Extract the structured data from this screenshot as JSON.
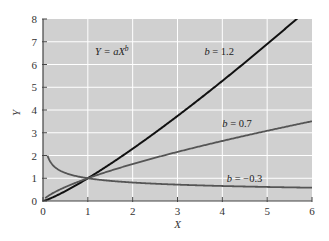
{
  "chart_data": {
    "type": "line",
    "title": "",
    "xlabel": "X",
    "ylabel": "Y",
    "xlim": [
      0,
      6
    ],
    "ylim": [
      0,
      8
    ],
    "xticks": [
      0,
      1,
      2,
      3,
      4,
      5,
      6
    ],
    "yticks": [
      0,
      1,
      2,
      3,
      4,
      5,
      6,
      7,
      8
    ],
    "grid": true,
    "equation_annotation": {
      "lhs": "Y = aX",
      "exponent": "b"
    },
    "series": [
      {
        "name": "b = 1.2",
        "a": 1,
        "b": 1.2,
        "x_start": 0,
        "color": "#111111",
        "label_var": "b",
        "label_rest": " = 1.2",
        "label_at": [
          3.6,
          6.4
        ]
      },
      {
        "name": "b = 0.7",
        "a": 1,
        "b": 0.7,
        "x_start": 0.05,
        "color": "#555555",
        "label_var": "b",
        "label_rest": " = 0.7",
        "label_at": [
          4.0,
          3.25
        ]
      },
      {
        "name": "b = -0.3",
        "a": 1,
        "b": -0.3,
        "x_start": 0.1,
        "color": "#555555",
        "label_var": "b",
        "label_rest": " = −0.3",
        "label_at": [
          4.1,
          0.85
        ]
      }
    ],
    "colors": {
      "plot_background": "#d0d0d0",
      "gridline": "#ffffff",
      "axis": "#444444"
    }
  }
}
